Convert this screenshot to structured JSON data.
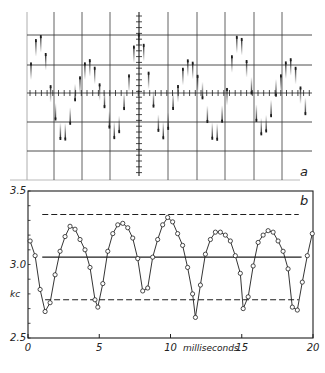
{
  "chart_data": [
    {
      "panel": "a",
      "type": "scatter",
      "description": "Oscillogram of sampled beat-frequency pulses on a graticule; vertical pulse strokes with amplitude envelope",
      "panel_label": "a",
      "graticule": {
        "horizontal_lines_y_px": [
          35,
          65,
          93,
          122,
          151
        ],
        "vertical_lines_x_px": [
          54,
          82,
          110,
          168,
          197,
          225,
          254,
          282
        ],
        "center_axis_x_px": 139,
        "center_axis_y_px": 93,
        "frame": {
          "left": 27,
          "top": 12,
          "right": 312,
          "bottom": 180
        }
      },
      "pulse_pattern": {
        "pulse_spacing_px": 4.9,
        "start_x_px": 31,
        "end_x_px": 309,
        "carrier_period_px": 50,
        "envelope_period_px": 96,
        "amplitude_px": 58
      }
    },
    {
      "panel": "b",
      "type": "line",
      "panel_label": "b",
      "title": "",
      "xlabel": "milliseconds",
      "ylabel": "kc",
      "xlim": [
        0,
        20
      ],
      "ylim": [
        2.5,
        3.5
      ],
      "x_ticks": [
        0,
        5,
        10,
        15,
        20
      ],
      "x_tick_labels": [
        "0",
        "5",
        "10",
        "15",
        "20"
      ],
      "y_ticks": [
        2.5,
        3.0,
        3.5
      ],
      "y_tick_labels": [
        "2.5",
        "3.0",
        "3.5"
      ],
      "y_minor_ticks": [
        2.6,
        2.7,
        2.8,
        2.9,
        3.1,
        3.2,
        3.3,
        3.4
      ],
      "grid": false,
      "series": [
        {
          "name": "instantaneous frequency",
          "style": "line-with-open-circles",
          "x": [
            0.15,
            0.5,
            0.85,
            1.2,
            1.55,
            1.9,
            2.25,
            2.6,
            2.95,
            3.3,
            3.65,
            4.0,
            4.35,
            4.7,
            4.9,
            5.25,
            5.6,
            5.95,
            6.3,
            6.65,
            7.0,
            7.35,
            7.7,
            8.05,
            8.4,
            8.75,
            9.1,
            9.45,
            9.8,
            10.15,
            10.5,
            10.85,
            11.2,
            11.55,
            11.75,
            12.1,
            12.45,
            12.8,
            13.15,
            13.5,
            13.85,
            14.2,
            14.55,
            14.9,
            15.1,
            15.45,
            15.8,
            16.15,
            16.5,
            16.85,
            17.2,
            17.55,
            17.9,
            18.25,
            18.55,
            18.9,
            19.25,
            19.6,
            19.95
          ],
          "y": [
            3.16,
            3.06,
            2.83,
            2.68,
            2.74,
            2.93,
            3.09,
            3.19,
            3.26,
            3.24,
            3.17,
            3.1,
            2.98,
            2.76,
            2.71,
            2.87,
            3.09,
            3.21,
            3.27,
            3.28,
            3.25,
            3.18,
            3.04,
            2.82,
            2.84,
            3.05,
            3.17,
            3.27,
            3.32,
            3.29,
            3.21,
            3.13,
            2.98,
            2.8,
            2.64,
            2.86,
            3.07,
            3.17,
            3.22,
            3.22,
            3.2,
            3.16,
            3.06,
            2.94,
            2.7,
            2.78,
            2.99,
            3.15,
            3.2,
            3.23,
            3.22,
            3.16,
            3.09,
            2.97,
            2.71,
            2.69,
            2.88,
            3.06,
            3.21
          ]
        }
      ],
      "reference_lines": [
        {
          "name": "upper limit",
          "y": 3.34,
          "x_range": [
            1.0,
            19.0
          ],
          "style": "dashed"
        },
        {
          "name": "mean",
          "y": 3.05,
          "x_range": [
            1.0,
            19.2
          ],
          "style": "solid"
        },
        {
          "name": "lower limit",
          "y": 2.76,
          "x_range": [
            1.2,
            19.0
          ],
          "style": "dashed"
        }
      ]
    }
  ],
  "colors": {
    "ink": "#1e1e1e",
    "grid": "#3a3a3a",
    "background": "#ffffff"
  }
}
